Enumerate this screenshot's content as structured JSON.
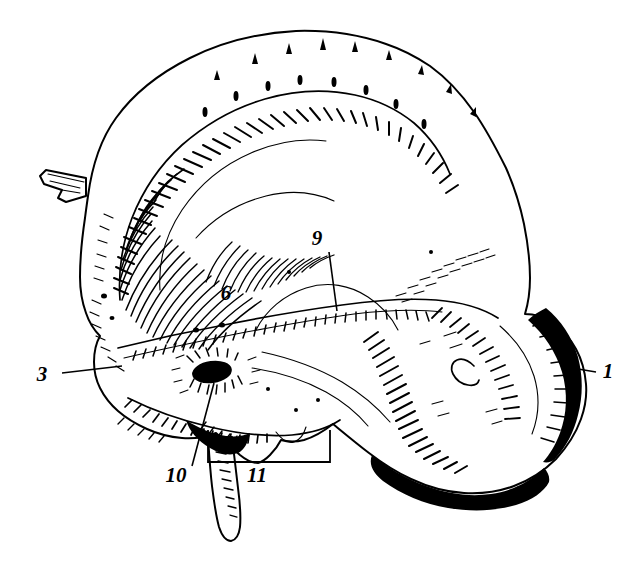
{
  "figure": {
    "kind": "anatomical-line-engraving",
    "background_color": "#ffffff",
    "ink_color": "#000000",
    "width": 628,
    "height": 563
  },
  "labels": [
    {
      "id": "label-1",
      "text": "1",
      "x": 608,
      "y": 378,
      "leader": {
        "type": "line",
        "x1": 578,
        "y1": 369,
        "x2": 596,
        "y2": 372
      }
    },
    {
      "id": "label-3",
      "text": "3",
      "x": 42,
      "y": 381,
      "leader": {
        "type": "line",
        "x1": 62,
        "y1": 373,
        "x2": 122,
        "y2": 366
      }
    },
    {
      "id": "label-6",
      "text": "6",
      "x": 226,
      "y": 300,
      "leader": {
        "type": "none"
      }
    },
    {
      "id": "label-9",
      "text": "9",
      "x": 317,
      "y": 245,
      "leader": {
        "type": "line",
        "x1": 329,
        "y1": 252,
        "x2": 337,
        "y2": 311
      }
    },
    {
      "id": "label-10",
      "text": "10",
      "x": 176,
      "y": 482,
      "leader": {
        "type": "line",
        "x1": 214,
        "y1": 383,
        "x2": 192,
        "y2": 466
      }
    },
    {
      "id": "label-11",
      "text": "11",
      "x": 257,
      "y": 482,
      "leader": {
        "type": "bracket",
        "left_x": 208,
        "right_x": 330,
        "bottom_y": 462,
        "top_y": 430
      }
    }
  ],
  "caption": ""
}
